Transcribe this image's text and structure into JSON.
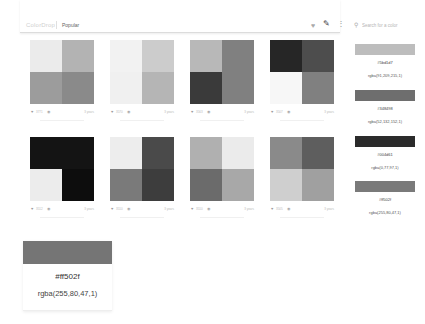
{
  "header": {
    "logo": "ColorDrop",
    "nav_popular": "Popular",
    "icons": {
      "like": "heart-icon",
      "create": "brush-icon",
      "more": "more-vertical-icon",
      "search": "search-icon"
    },
    "search_placeholder": "Search for a color"
  },
  "palettes": [
    {
      "colors": [
        "#ebebeb",
        "#b3b3b3",
        "#9c9c9c",
        "#8a8a8a"
      ],
      "likes": "3771",
      "date": "3 years"
    },
    {
      "colors": [
        "#f2f2f2",
        "#cccccc",
        "#f0f0f0",
        "#b5b5b5"
      ],
      "likes": "3570",
      "date": "3 years"
    },
    {
      "colors": [
        "#b8b8b8",
        "#808080",
        "#3a3a3a",
        "#808080"
      ],
      "likes": "3563",
      "date": "3 years"
    },
    {
      "colors": [
        "#262626",
        "#4d4d4d",
        "#f7f7f7",
        "#808080"
      ],
      "likes": "3507",
      "date": "3 years"
    },
    {
      "colors": [
        "#141414",
        "#141414",
        "#ececec",
        "#0d0d0d"
      ],
      "likes": "3512",
      "date": "3 years"
    },
    {
      "colors": [
        "#ededed",
        "#4a4a4a",
        "#7a7a7a",
        "#3d3d3d"
      ],
      "likes": "3510",
      "date": "3 years"
    },
    {
      "colors": [
        "#b0b0b0",
        "#ebebeb",
        "#6b6b6b",
        "#a8a8a8"
      ],
      "likes": "3510",
      "date": "3 years"
    },
    {
      "colors": [
        "#8a8a8a",
        "#5e5e5e",
        "#cfcfcf",
        "#a0a0a0"
      ],
      "likes": "3505",
      "date": "3 years"
    }
  ],
  "side_colors": [
    {
      "swatch": "#bdbdbd",
      "hex": "#5bd1d7",
      "rgba": "rgba(91,209,215,1)"
    },
    {
      "swatch": "#6e6e6e",
      "hex": "#348498",
      "rgba": "rgba(52,132,152,1)"
    },
    {
      "swatch": "#2b2b2b",
      "hex": "#004d61",
      "rgba": "rgba(0,77,97,1)"
    },
    {
      "swatch": "#7a7a7a",
      "hex": "#ff502f",
      "rgba": "rgba(255,80,47,1)"
    }
  ],
  "popup": {
    "swatch": "#757575",
    "hex": "#ff502f",
    "rgba": "rgba(255,80,47,1)"
  }
}
